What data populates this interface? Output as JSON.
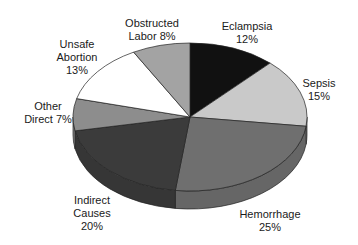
{
  "chart_data": {
    "type": "pie",
    "style": "3d-pie",
    "title": "",
    "categories": [
      "Eclampsia",
      "Sepsis",
      "Hemorrhage",
      "Indirect Causes",
      "Other Direct",
      "Unsafe Abortion",
      "Obstructed Labor"
    ],
    "values": [
      12,
      15,
      25,
      20,
      7,
      13,
      8
    ],
    "unit": "%",
    "colors": [
      "#111111",
      "#c9c9c9",
      "#6f6f6f",
      "#3b3b3b",
      "#8d8d8d",
      "#ffffff",
      "#a3a3a3"
    ],
    "start_angle": "12 o'clock",
    "direction": "clockwise",
    "legend": "none (direct labels)",
    "labels": [
      {
        "lines": [
          "Eclampsia",
          "12%"
        ],
        "x": 247,
        "y": 20
      },
      {
        "lines": [
          "Sepsis",
          "15%"
        ],
        "x": 319,
        "y": 77
      },
      {
        "lines": [
          "Hemorrhage",
          "25%"
        ],
        "x": 270,
        "y": 208
      },
      {
        "lines": [
          "Indirect",
          "Causes",
          "20%"
        ],
        "x": 92,
        "y": 194
      },
      {
        "lines": [
          "Other",
          "Direct 7%"
        ],
        "x": 48,
        "y": 100
      },
      {
        "lines": [
          "Unsafe",
          "Abortion",
          "13%"
        ],
        "x": 77,
        "y": 38
      },
      {
        "lines": [
          "Obstructed",
          "Labor 8%"
        ],
        "x": 152,
        "y": 17
      }
    ]
  }
}
